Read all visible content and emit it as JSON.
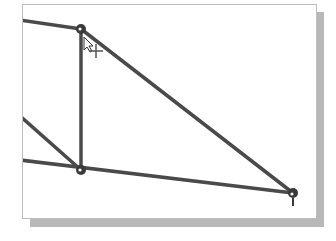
{
  "canvas": {
    "frame_color": "#bdbdbd",
    "shadow_color": "#b8b8b8",
    "line_color": "#4a4a4a"
  },
  "nodes": [
    {
      "id": "top-node",
      "x": 81,
      "y": 29
    },
    {
      "id": "bottom-left-node",
      "x": 81,
      "y": 170
    },
    {
      "id": "bottom-right-node",
      "x": 293,
      "y": 193
    }
  ],
  "members": [
    {
      "from": [
        22,
        20
      ],
      "to": [
        81,
        29
      ]
    },
    {
      "from": [
        81,
        29
      ],
      "to": [
        81,
        170
      ]
    },
    {
      "from": [
        81,
        29
      ],
      "to": [
        293,
        193
      ]
    },
    {
      "from": [
        22,
        118
      ],
      "to": [
        81,
        170
      ]
    },
    {
      "from": [
        22,
        160
      ],
      "to": [
        293,
        193
      ]
    }
  ],
  "cursor": {
    "type": "move-cursor",
    "x": 86,
    "y": 38
  }
}
